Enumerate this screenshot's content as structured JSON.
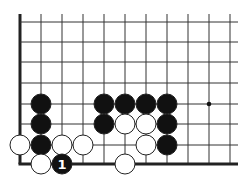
{
  "diagram": {
    "type": "go-board-corner",
    "grid": {
      "columns_x": [
        20,
        41,
        62,
        83,
        104,
        125,
        146,
        167,
        188,
        209,
        230
      ],
      "rows_y": [
        22,
        42,
        62,
        83,
        104,
        124,
        145,
        164
      ],
      "top_y": 14,
      "right_x": 238,
      "line_color": "#333333",
      "edge_color": "#222222"
    },
    "star_points": [
      {
        "col": 9,
        "row": 4
      }
    ],
    "stones": [
      {
        "col": 1,
        "row": 4,
        "color": "black"
      },
      {
        "col": 4,
        "row": 4,
        "color": "black"
      },
      {
        "col": 5,
        "row": 4,
        "color": "black"
      },
      {
        "col": 6,
        "row": 4,
        "color": "black"
      },
      {
        "col": 7,
        "row": 4,
        "color": "black"
      },
      {
        "col": 1,
        "row": 5,
        "color": "black"
      },
      {
        "col": 4,
        "row": 5,
        "color": "black"
      },
      {
        "col": 5,
        "row": 5,
        "color": "white"
      },
      {
        "col": 6,
        "row": 5,
        "color": "white"
      },
      {
        "col": 7,
        "row": 5,
        "color": "black"
      },
      {
        "col": 0,
        "row": 6,
        "color": "white"
      },
      {
        "col": 1,
        "row": 6,
        "color": "black"
      },
      {
        "col": 2,
        "row": 6,
        "color": "white"
      },
      {
        "col": 3,
        "row": 6,
        "color": "white"
      },
      {
        "col": 6,
        "row": 6,
        "color": "white"
      },
      {
        "col": 7,
        "row": 6,
        "color": "black"
      },
      {
        "col": 1,
        "row": 7,
        "color": "white"
      },
      {
        "col": 2,
        "row": 7,
        "color": "black",
        "label": "1"
      },
      {
        "col": 5,
        "row": 7,
        "color": "white"
      }
    ],
    "move_label": "1"
  }
}
